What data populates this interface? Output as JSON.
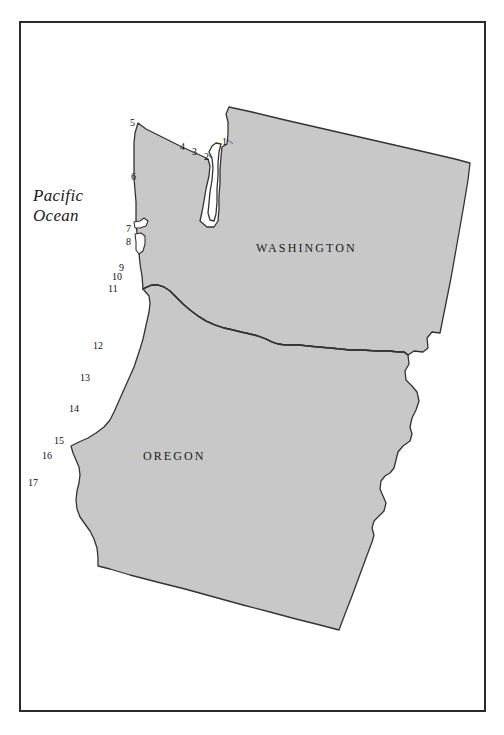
{
  "map": {
    "title_visible": false,
    "background_color": "#ffffff",
    "land_fill_color": "#c8c8c8",
    "land_stroke_color": "#333333",
    "frame_color": "#2b2b2b",
    "ocean_label": {
      "line1": "Pacific",
      "line2": "Ocean",
      "x": 33,
      "y": 186
    },
    "state_labels": [
      {
        "name": "washington-label",
        "text": "WASHINGTON",
        "x": 256,
        "y": 241
      },
      {
        "name": "oregon-label",
        "text": "OREGON",
        "x": 143,
        "y": 449
      }
    ],
    "coastal_markers": [
      {
        "id": 1,
        "label": "1",
        "x": 222,
        "y": 137
      },
      {
        "id": 2,
        "label": "2",
        "x": 204,
        "y": 152
      },
      {
        "id": 3,
        "label": "3",
        "x": 192,
        "y": 147
      },
      {
        "id": 4,
        "label": "4",
        "x": 180,
        "y": 142
      },
      {
        "id": 5,
        "label": "5",
        "x": 130,
        "y": 118
      },
      {
        "id": 6,
        "label": "6",
        "x": 131,
        "y": 172
      },
      {
        "id": 7,
        "label": "7",
        "x": 126,
        "y": 224
      },
      {
        "id": 8,
        "label": "8",
        "x": 126,
        "y": 237
      },
      {
        "id": 9,
        "label": "9",
        "x": 119,
        "y": 263
      },
      {
        "id": 10,
        "label": "10",
        "x": 112,
        "y": 272
      },
      {
        "id": 11,
        "label": "11",
        "x": 108,
        "y": 284
      },
      {
        "id": 12,
        "label": "12",
        "x": 93,
        "y": 341
      },
      {
        "id": 13,
        "label": "13",
        "x": 80,
        "y": 373
      },
      {
        "id": 14,
        "label": "14",
        "x": 69,
        "y": 404
      },
      {
        "id": 15,
        "label": "15",
        "x": 54,
        "y": 436
      },
      {
        "id": 16,
        "label": "16",
        "x": 42,
        "y": 451
      },
      {
        "id": 17,
        "label": "17",
        "x": 28,
        "y": 478
      }
    ]
  }
}
